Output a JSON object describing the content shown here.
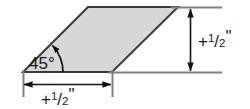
{
  "figure": {
    "name": "parallelogram-dimension-drawing",
    "shape": {
      "type": "parallelogram",
      "fill_color": "#d8d8d8",
      "stroke_color": "#3a3a3a"
    },
    "angle": {
      "value": "45",
      "degree_symbol": "°",
      "label": "45°"
    },
    "dimensions": [
      {
        "id": "bottom",
        "orientation": "horizontal",
        "sign": "+",
        "numerator": "1",
        "slash": "/",
        "denominator": "2",
        "unit": "\"",
        "label": "+1/2\""
      },
      {
        "id": "right",
        "orientation": "vertical",
        "sign": "+",
        "numerator": "1",
        "slash": "/",
        "denominator": "2",
        "unit": "\"",
        "label": "+1/2\""
      }
    ]
  }
}
